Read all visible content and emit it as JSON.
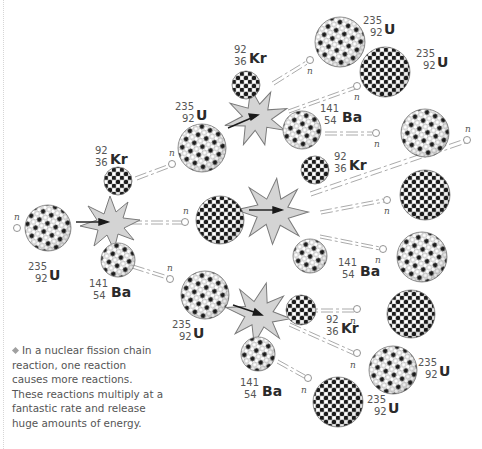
{
  "caption": {
    "bullet_icon": "diamond-bullet",
    "text": "In a nuclear fission chain reaction, one reaction causes more reactions. These reactions multiply at a fantastic rate and release huge amounts of energy."
  },
  "neutron_label": "n",
  "isotopes": {
    "uranium": {
      "mass": "235",
      "atomic": "92",
      "symbol": "U"
    },
    "krypton": {
      "mass": "92",
      "atomic": "36",
      "symbol": "Kr"
    },
    "barium": {
      "mass": "141",
      "atomic": "54",
      "symbol": "Ba"
    }
  },
  "labels": [
    {
      "id": "u-initial",
      "isotope": "uranium",
      "x": 28,
      "y": 262
    },
    {
      "id": "kr-gen1",
      "isotope": "krypton",
      "x": 93,
      "y": 150
    },
    {
      "id": "ba-gen1",
      "isotope": "barium",
      "x": 89,
      "y": 281
    },
    {
      "id": "u-gen2-top",
      "isotope": "uranium",
      "x": 173,
      "y": 104
    },
    {
      "id": "u-gen2-bottom",
      "isotope": "uranium",
      "x": 170,
      "y": 322
    },
    {
      "id": "kr-gen2-top",
      "isotope": "krypton",
      "x": 232,
      "y": 47
    },
    {
      "id": "ba-gen2-top",
      "isotope": "barium",
      "x": 318,
      "y": 106
    },
    {
      "id": "kr-gen2-mid",
      "isotope": "krypton",
      "x": 332,
      "y": 153
    },
    {
      "id": "ba-gen2-mid",
      "isotope": "barium",
      "x": 327,
      "y": 260
    },
    {
      "id": "kr-gen2-bottom",
      "isotope": "krypton",
      "x": 325,
      "y": 313
    },
    {
      "id": "ba-gen2-bottom",
      "isotope": "barium",
      "x": 240,
      "y": 376
    },
    {
      "id": "u-gen3-1",
      "isotope": "uranium",
      "x": 363,
      "y": 18
    },
    {
      "id": "u-gen3-2",
      "isotope": "uranium",
      "x": 415,
      "y": 52
    },
    {
      "id": "u-gen3-3",
      "isotope": "uranium",
      "x": 417,
      "y": 354
    },
    {
      "id": "u-gen3-4",
      "isotope": "uranium",
      "x": 365,
      "y": 397
    }
  ],
  "colors": {
    "starburst_fill": "#d4d4d4",
    "starburst_stroke": "#7a7a7a",
    "nucleon_dark": "#1c1c1c",
    "nucleon_light": "#ffffff",
    "neutron_path": "#9a9a9a",
    "caption_text": "#555555"
  }
}
